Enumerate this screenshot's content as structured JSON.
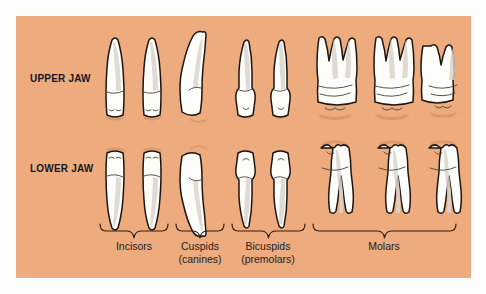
{
  "figure": {
    "panel_color": "#eeab7d",
    "background_color": "#fdfdfb",
    "tooth_fill": "#fdfdfa",
    "tooth_outline": "#1d1510",
    "label_color": "#17161f"
  },
  "rows": [
    {
      "id": "upper",
      "label": "UPPER JAW"
    },
    {
      "id": "lower",
      "label": "LOWER JAW"
    }
  ],
  "groups": [
    {
      "id": "incisors",
      "name": "Incisors",
      "subtitle": "",
      "tooth_count_per_row": 2,
      "brace": {
        "x1": 100,
        "x2": 168,
        "label_center": 134
      }
    },
    {
      "id": "cuspids",
      "name": "Cuspids",
      "subtitle": "(canines)",
      "tooth_count_per_row": 1,
      "brace": {
        "x1": 176,
        "x2": 224,
        "label_center": 200
      }
    },
    {
      "id": "bicuspids",
      "name": "Bicuspids",
      "subtitle": "(premolars)",
      "tooth_count_per_row": 2,
      "brace": {
        "x1": 232,
        "x2": 305,
        "label_center": 268
      }
    },
    {
      "id": "molars",
      "name": "Molars",
      "subtitle": "",
      "tooth_count_per_row": 3,
      "brace": {
        "x1": 313,
        "x2": 456,
        "label_center": 384
      }
    }
  ],
  "teeth": {
    "upper": [
      {
        "group": "incisors",
        "type": "incisor",
        "cx": 115,
        "name": "upper-incisor-1"
      },
      {
        "group": "incisors",
        "type": "incisor",
        "cx": 152,
        "name": "upper-incisor-2"
      },
      {
        "group": "cuspids",
        "type": "cuspid",
        "cx": 199,
        "name": "upper-cuspid-1"
      },
      {
        "group": "bicuspids",
        "type": "bicuspid",
        "cx": 246,
        "name": "upper-bicuspid-1"
      },
      {
        "group": "bicuspids",
        "type": "bicuspid",
        "cx": 281,
        "name": "upper-bicuspid-2"
      },
      {
        "group": "molars",
        "type": "molar-3root",
        "cx": 335,
        "name": "upper-molar-1"
      },
      {
        "group": "molars",
        "type": "molar-3root",
        "cx": 392,
        "name": "upper-molar-2"
      },
      {
        "group": "molars",
        "type": "molar-2root-small",
        "cx": 443,
        "name": "upper-molar-3"
      }
    ],
    "lower": [
      {
        "group": "incisors",
        "type": "incisor",
        "cx": 115,
        "name": "lower-incisor-1"
      },
      {
        "group": "incisors",
        "type": "incisor",
        "cx": 152,
        "name": "lower-incisor-2"
      },
      {
        "group": "cuspids",
        "type": "cuspid",
        "cx": 199,
        "name": "lower-cuspid-1"
      },
      {
        "group": "bicuspids",
        "type": "bicuspid",
        "cx": 246,
        "name": "lower-bicuspid-1"
      },
      {
        "group": "bicuspids",
        "type": "bicuspid",
        "cx": 281,
        "name": "lower-bicuspid-2"
      },
      {
        "group": "molars",
        "type": "molar-2root",
        "cx": 335,
        "name": "lower-molar-1"
      },
      {
        "group": "molars",
        "type": "molar-2root",
        "cx": 392,
        "name": "lower-molar-2"
      },
      {
        "group": "molars",
        "type": "molar-2root",
        "cx": 443,
        "name": "lower-molar-3"
      }
    ]
  },
  "label_positions": {
    "upper_jaw": {
      "left": 30,
      "top": 73
    },
    "lower_jaw": {
      "left": 30,
      "top": 163
    },
    "group_label_top": 240,
    "brace_top": 224
  }
}
